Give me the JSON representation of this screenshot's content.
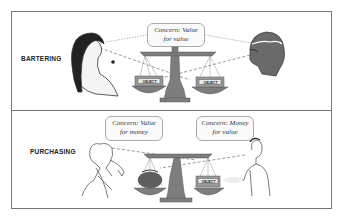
{
  "panels": [
    {
      "label": "BARTERING",
      "bubbles": [
        {
          "line1": "Concern: Value",
          "line2": "for value"
        }
      ],
      "left_pan": "OBJECT",
      "right_pan": "OBJECT"
    },
    {
      "label": "PURCHASING",
      "bubbles": [
        {
          "line1": "Concern: Value",
          "line2": "for money"
        },
        {
          "line1": "Concern: Money",
          "line2": "for value"
        }
      ],
      "left_pan": "money-bag",
      "right_pan": "OBJECT"
    }
  ],
  "colors": {
    "scale": "#7d7d7d",
    "border": "#777777",
    "figure": "#555555"
  }
}
